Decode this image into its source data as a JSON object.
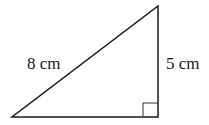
{
  "diagram": {
    "type": "right-triangle",
    "labels": {
      "hypotenuse": "8 cm",
      "vertical_side": "5 cm"
    },
    "right_angle_marker": "bottom-right"
  }
}
